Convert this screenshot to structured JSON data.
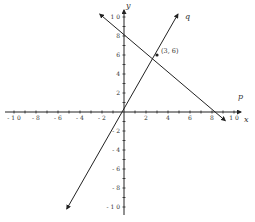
{
  "chart_data": {
    "type": "line",
    "title": "",
    "xlabel": "x",
    "ylabel": "y",
    "xlim": [
      -10,
      10
    ],
    "ylim": [
      -10,
      10
    ],
    "grid": false,
    "x_ticks": [
      -10,
      -8,
      -6,
      -4,
      -2,
      2,
      4,
      6,
      8,
      10
    ],
    "y_ticks": [
      -10,
      -8,
      -6,
      -4,
      -2,
      2,
      4,
      6,
      8,
      10
    ],
    "x_tick_labels": [
      "- 1 0",
      "- 8",
      "- 6",
      "- 4",
      "- 2",
      "2",
      "4",
      "6",
      "8",
      "1 0"
    ],
    "y_tick_labels_pos": [
      "2",
      "4",
      "6",
      "8",
      "1 0"
    ],
    "y_tick_labels_neg": [
      "- 2",
      "- 4",
      "- 6",
      "- 8",
      "- 1 0"
    ],
    "series": [
      {
        "name": "q",
        "equation": "y = 2x",
        "x": [
          -5.2,
          0,
          3,
          4.9
        ],
        "y": [
          -10.2,
          0,
          6,
          10.3
        ],
        "color": "#222222",
        "arrows": "both"
      },
      {
        "name": "p",
        "equation": "y = -2/3 x + 8",
        "x": [
          -2.2,
          0,
          3,
          9.2
        ],
        "y": [
          10.3,
          8,
          6,
          -0.9
        ],
        "color": "#222222",
        "arrows": "both"
      }
    ],
    "annotations": [
      {
        "text": "(3, 6)",
        "x": 3,
        "y": 6,
        "marker": "dot"
      }
    ],
    "labels": {
      "x_axis": "x",
      "y_axis": "y",
      "line_q": "q",
      "line_p": "p",
      "intersection": "(3, 6)"
    }
  }
}
